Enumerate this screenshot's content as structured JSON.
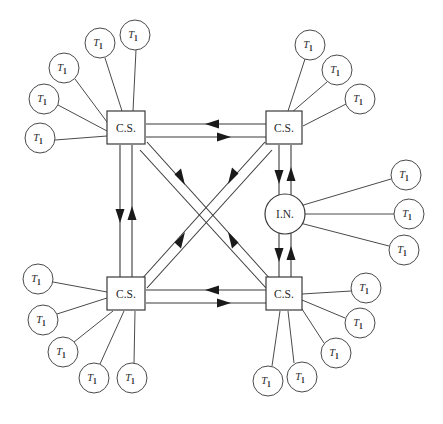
{
  "diagram": {
    "canvas": {
      "width": 443,
      "height": 424,
      "background": "#ffffff"
    },
    "style": {
      "line_color": "#3a3a3a",
      "spoke_color": "#4a4a4a",
      "arrow_color": "#1a1a1a",
      "node_fill": "#ffffff",
      "label_color": "#2b2b2b"
    },
    "labels": {
      "central_station": "C.S.",
      "interface_node": "I.N.",
      "terminal_base": "T",
      "terminal_subscript": "1"
    },
    "nodes": [
      {
        "id": "cs-top-left",
        "type": "box",
        "label": "C.S.",
        "x": 126,
        "y": 128,
        "w": 38,
        "h": 33
      },
      {
        "id": "cs-top-right",
        "type": "box",
        "label": "C.S.",
        "x": 284,
        "y": 128,
        "w": 36,
        "h": 33
      },
      {
        "id": "cs-bottom-left",
        "type": "box",
        "label": "C.S.",
        "x": 126,
        "y": 294,
        "w": 38,
        "h": 33
      },
      {
        "id": "cs-bottom-right",
        "type": "box",
        "label": "C.S.",
        "x": 284,
        "y": 294,
        "w": 36,
        "h": 33
      },
      {
        "id": "in-right",
        "type": "circle",
        "label": "I.N.",
        "x": 285,
        "y": 214,
        "r": 20
      }
    ],
    "terminals": [
      {
        "id": "t-tl-1",
        "parent": "cs-top-left",
        "x": 40,
        "y": 138,
        "r": 15
      },
      {
        "id": "t-tl-2",
        "parent": "cs-top-left",
        "x": 44,
        "y": 99,
        "r": 15
      },
      {
        "id": "t-tl-3",
        "parent": "cs-top-left",
        "x": 64,
        "y": 68,
        "r": 15
      },
      {
        "id": "t-tl-4",
        "parent": "cs-top-left",
        "x": 100,
        "y": 43,
        "r": 15
      },
      {
        "id": "t-tl-5",
        "parent": "cs-top-left",
        "x": 135,
        "y": 35,
        "r": 15
      },
      {
        "id": "t-tr-1",
        "parent": "cs-top-right",
        "x": 310,
        "y": 45,
        "r": 15
      },
      {
        "id": "t-tr-2",
        "parent": "cs-top-right",
        "x": 337,
        "y": 70,
        "r": 15
      },
      {
        "id": "t-tr-3",
        "parent": "cs-top-right",
        "x": 360,
        "y": 99,
        "r": 15
      },
      {
        "id": "t-in-1",
        "parent": "in-right",
        "x": 406,
        "y": 175,
        "r": 15
      },
      {
        "id": "t-in-2",
        "parent": "in-right",
        "x": 409,
        "y": 214,
        "r": 15
      },
      {
        "id": "t-in-3",
        "parent": "in-right",
        "x": 404,
        "y": 250,
        "r": 15
      },
      {
        "id": "t-bl-1",
        "parent": "cs-bottom-left",
        "x": 38,
        "y": 279,
        "r": 15
      },
      {
        "id": "t-bl-2",
        "parent": "cs-bottom-left",
        "x": 43,
        "y": 320,
        "r": 15
      },
      {
        "id": "t-bl-3",
        "parent": "cs-bottom-left",
        "x": 63,
        "y": 352,
        "r": 15
      },
      {
        "id": "t-bl-4",
        "parent": "cs-bottom-left",
        "x": 94,
        "y": 378,
        "r": 15
      },
      {
        "id": "t-bl-5",
        "parent": "cs-bottom-left",
        "x": 132,
        "y": 378,
        "r": 15
      },
      {
        "id": "t-br-1",
        "parent": "cs-bottom-right",
        "x": 366,
        "y": 288,
        "r": 15
      },
      {
        "id": "t-br-2",
        "parent": "cs-bottom-right",
        "x": 360,
        "y": 323,
        "r": 15
      },
      {
        "id": "t-br-3",
        "parent": "cs-bottom-right",
        "x": 336,
        "y": 353,
        "r": 15
      },
      {
        "id": "t-br-4",
        "parent": "cs-bottom-right",
        "x": 302,
        "y": 377,
        "r": 15
      },
      {
        "id": "t-br-5",
        "parent": "cs-bottom-right",
        "x": 268,
        "y": 381,
        "r": 15
      }
    ],
    "trunk_links": [
      {
        "id": "link-top",
        "from": "cs-top-left",
        "to": "cs-top-right",
        "orientation": "horizontal",
        "bidirectional": true
      },
      {
        "id": "link-bottom",
        "from": "cs-bottom-left",
        "to": "cs-bottom-right",
        "orientation": "horizontal",
        "bidirectional": true
      },
      {
        "id": "link-left",
        "from": "cs-top-left",
        "to": "cs-bottom-left",
        "orientation": "vertical",
        "bidirectional": true
      },
      {
        "id": "link-right-up",
        "from": "cs-top-right",
        "to": "in-right",
        "orientation": "vertical",
        "bidirectional": true
      },
      {
        "id": "link-right-dn",
        "from": "in-right",
        "to": "cs-bottom-right",
        "orientation": "vertical",
        "bidirectional": true
      },
      {
        "id": "link-diag-a",
        "from": "cs-top-left",
        "to": "cs-bottom-right",
        "orientation": "diagonal",
        "bidirectional": true
      },
      {
        "id": "link-diag-b",
        "from": "cs-top-right",
        "to": "cs-bottom-left",
        "orientation": "diagonal",
        "bidirectional": true
      }
    ],
    "counts": {
      "central_stations": 4,
      "interface_nodes": 1,
      "terminals": 21
    }
  }
}
